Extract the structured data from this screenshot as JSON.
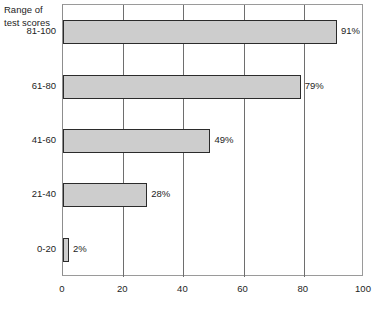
{
  "chart_data": {
    "type": "bar",
    "orientation": "horizontal",
    "title": "",
    "ylabel": "Range of\ntest scores",
    "xlabel": "",
    "categories": [
      "81-100",
      "61-80",
      "41-60",
      "21-40",
      "0-20"
    ],
    "values": [
      91,
      79,
      49,
      28,
      2
    ],
    "value_labels": [
      "91%",
      "79%",
      "49%",
      "28%",
      "2%"
    ],
    "xlim": [
      0,
      100
    ],
    "xticks": [
      0,
      20,
      40,
      60,
      80,
      100
    ],
    "xtick_labels": [
      "0",
      "20",
      "40",
      "60",
      "80",
      "100"
    ],
    "grid": "vertical",
    "legend": "none",
    "series": [
      {
        "name": "Percent",
        "values": [
          91,
          79,
          49,
          28,
          2
        ]
      }
    ],
    "colors": {
      "bar_fill": "#cdcdcd",
      "bar_border": "#2b2b2b",
      "gridline": "#6e6e6e",
      "frame": "#9a9a9a",
      "text": "#1d1d1d",
      "background": "#ffffff"
    }
  }
}
